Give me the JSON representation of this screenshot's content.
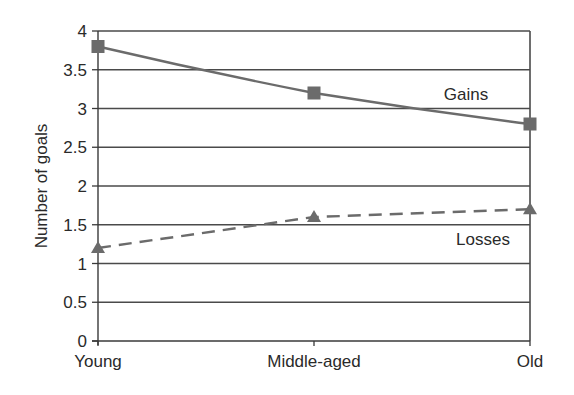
{
  "chart_data": {
    "type": "line",
    "title": "",
    "xlabel": "",
    "ylabel": "Number of goals",
    "categories": [
      "Young",
      "Middle-aged",
      "Old"
    ],
    "ylim": [
      0,
      4
    ],
    "yticks": [
      0,
      0.5,
      1,
      1.5,
      2,
      2.5,
      3,
      3.5,
      4
    ],
    "ytick_labels": [
      "0",
      "0.5",
      "1",
      "1.5",
      "2",
      "2.5",
      "3",
      "3.5",
      "4"
    ],
    "grid": true,
    "legend": "inline labels",
    "series": [
      {
        "name": "Gains",
        "values": [
          3.8,
          3.2,
          2.8
        ],
        "line_style": "solid",
        "marker": "square",
        "color": "#6b6b6b"
      },
      {
        "name": "Losses",
        "values": [
          1.2,
          1.6,
          1.7
        ],
        "line_style": "dashed",
        "marker": "triangle",
        "color": "#6b6b6b"
      }
    ],
    "annotations": [
      {
        "text": "Gains",
        "near": "Gains series, between Middle-aged and Old"
      },
      {
        "text": "Losses",
        "near": "Losses series, between Middle-aged and Old"
      }
    ]
  },
  "colors": {
    "axis": "#3a3a3a",
    "grid": "#4a4a4a",
    "series": "#6b6b6b",
    "text": "#2a2a2a",
    "background": "#ffffff"
  }
}
